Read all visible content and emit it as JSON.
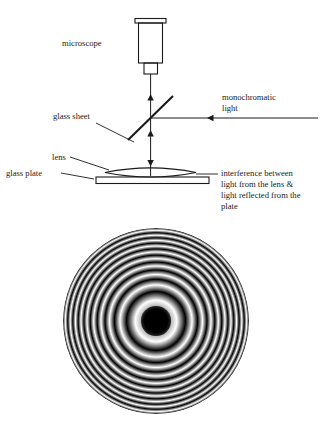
{
  "figure": {
    "ink_color": "#1a1a1a",
    "background_color": "#ffffff"
  },
  "diagram": {
    "labels": {
      "microscope": "microscope",
      "monochromatic_light_line1": "monochromatic",
      "monochromatic_light_line2": "light",
      "glass_sheet": "glass sheet",
      "lens": "lens",
      "glass_plate": "glass plate",
      "interference_line1": "interference between",
      "interference_line2": "light from the lens &",
      "interference_line3": "light reflected from the",
      "interference_line4": "plate"
    }
  },
  "pattern": {
    "name": "newtons-rings",
    "center_is_dark": true,
    "ring_count_visible": 9,
    "dark_color": "#000000",
    "light_color": "#ffffff",
    "center_x": 170,
    "center_y": 321,
    "radius": 93
  }
}
